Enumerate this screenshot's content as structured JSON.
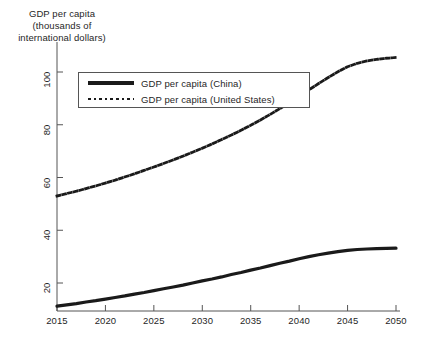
{
  "chart_data": {
    "type": "line",
    "title": "",
    "ylabel": "GDP per capita\n(thousands of\ninternational dollars)",
    "xlabel": "",
    "xlim": [
      2015,
      2050
    ],
    "ylim": [
      10,
      108
    ],
    "grid": false,
    "legend_position": "upper-left-inside",
    "xticks": [
      2015,
      2020,
      2025,
      2030,
      2035,
      2040,
      2045,
      2050
    ],
    "xtick_labels": [
      "2015",
      "2020",
      "2025",
      "2030",
      "2035",
      "2040",
      "2045",
      "2050"
    ],
    "yticks": [
      20,
      40,
      60,
      80,
      100
    ],
    "ytick_labels": [
      "20",
      "40",
      "60",
      "80",
      "100"
    ],
    "x": [
      2015,
      2016,
      2017,
      2018,
      2019,
      2020,
      2021,
      2022,
      2023,
      2024,
      2025,
      2026,
      2027,
      2028,
      2029,
      2030,
      2031,
      2032,
      2033,
      2034,
      2035,
      2036,
      2037,
      2038,
      2039,
      2040,
      2041,
      2042,
      2043,
      2044,
      2045,
      2046,
      2047,
      2048,
      2049,
      2050
    ],
    "series": [
      {
        "name": "GDP per capita (China)",
        "style": "solid",
        "color": "#1a1a1a",
        "width": 3.2,
        "values": [
          11.2,
          11.7,
          12.2,
          12.8,
          13.3,
          13.9,
          14.5,
          15.1,
          15.8,
          16.4,
          17.1,
          17.8,
          18.5,
          19.2,
          20.0,
          20.8,
          21.5,
          22.3,
          23.2,
          24.0,
          24.9,
          25.7,
          26.6,
          27.5,
          28.3,
          29.2,
          30.0,
          30.7,
          31.3,
          31.9,
          32.4,
          32.7,
          32.9,
          33.0,
          33.1,
          33.2
        ]
      },
      {
        "name": "GDP per capita (United States)",
        "style": "dotted",
        "color": "#1a1a1a",
        "width": 2.8,
        "values": [
          53.0,
          53.9,
          54.8,
          55.8,
          56.8,
          57.9,
          59.0,
          60.2,
          61.4,
          62.7,
          64.0,
          65.3,
          66.7,
          68.1,
          69.6,
          71.1,
          72.7,
          74.4,
          76.1,
          77.9,
          79.8,
          81.8,
          83.9,
          86.1,
          88.4,
          90.8,
          93.2,
          95.6,
          97.9,
          100.1,
          102.0,
          103.3,
          104.2,
          104.8,
          105.2,
          105.5
        ]
      }
    ],
    "legend_entries": [
      {
        "label": "GDP per capita (China)",
        "style": "solid"
      },
      {
        "label": "GDP per capita (United States)",
        "style": "dotted"
      }
    ]
  }
}
